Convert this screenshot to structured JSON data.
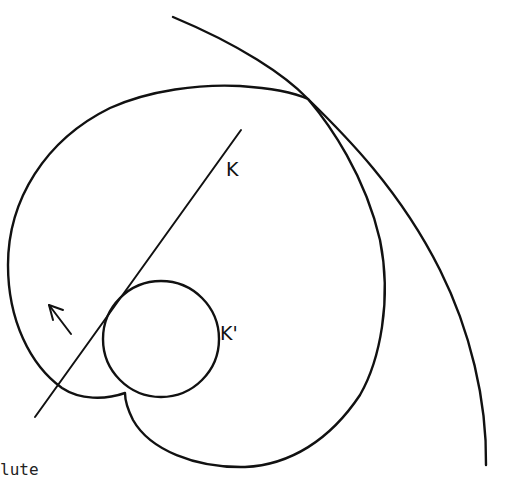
{
  "diagram": {
    "labels": {
      "line": "K",
      "circle": "K'"
    },
    "caption_fragment": "lute",
    "colors": {
      "stroke": "#111111",
      "background": "#ffffff"
    },
    "elements": [
      {
        "type": "curve",
        "name": "heart-shaped cardioid-like curve with cusp at bottom"
      },
      {
        "type": "arc",
        "name": "large outer arc crossing the curve near top right"
      },
      {
        "type": "line",
        "name": "tangent line K"
      },
      {
        "type": "circle",
        "name": "small rolling circle K'"
      },
      {
        "type": "arrow",
        "name": "direction of motion arrow (pointing up-left)"
      }
    ]
  }
}
